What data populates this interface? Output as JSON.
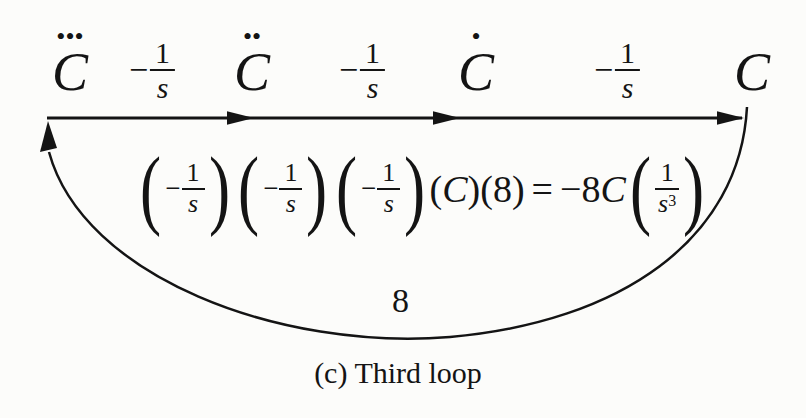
{
  "diagram": {
    "background_color": "#fcfcfa",
    "ink_color": "#141414",
    "nodes": [
      {
        "dots": "•••",
        "label": "C"
      },
      {
        "dots": "••",
        "label": "C"
      },
      {
        "dots": "•",
        "label": "C"
      },
      {
        "dots": "",
        "label": "C"
      }
    ],
    "gains": [
      {
        "sign": "−",
        "num": "1",
        "den": "s"
      },
      {
        "sign": "−",
        "num": "1",
        "den": "s"
      },
      {
        "sign": "−",
        "num": "1",
        "den": "s"
      }
    ],
    "loop_gain_label": "8",
    "equation": {
      "factors": [
        {
          "open": "(",
          "sign": "−",
          "num": "1",
          "den": "s",
          "close": ")"
        },
        {
          "open": "(",
          "sign": "−",
          "num": "1",
          "den": "s",
          "close": ")"
        },
        {
          "open": "(",
          "sign": "−",
          "num": "1",
          "den": "s",
          "close": ")"
        }
      ],
      "c_open": "(",
      "c_var": "C",
      "c_close": ")",
      "g_open": "(",
      "g_val": "8",
      "g_close": ")",
      "equals": "=",
      "rhs_coeff": "−8",
      "rhs_var": "C",
      "rhs_frac": {
        "open": "(",
        "num": "1",
        "den_base": "s",
        "den_exp": "3",
        "close": ")"
      }
    },
    "caption": "(c) Third loop"
  }
}
